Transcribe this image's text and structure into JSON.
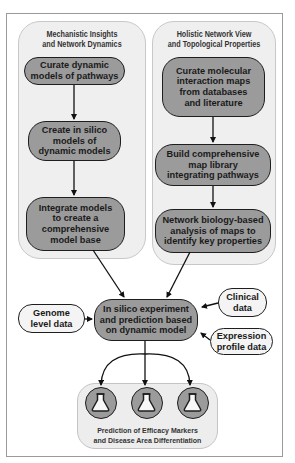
{
  "left_panel": {
    "title": "Mechanistic Insights\nand Network Dynamics",
    "steps": [
      {
        "label": "Curate dynamic\nmodels of pathways"
      },
      {
        "label": "Create in silico\nmodels of\ndynamic models"
      },
      {
        "label": "Integrate models\nto create a\ncomprehensive\nmodel base"
      }
    ]
  },
  "right_panel": {
    "title": "Holistic Network View\nand Topological Properties",
    "steps": [
      {
        "label": "Curate molecular\ninteraction maps\nfrom databases\nand literature"
      },
      {
        "label": "Build comprehensive\nmap library\nintegrating pathways"
      },
      {
        "label": "Network biology-based\nanalysis of maps to\nidentify key properties"
      }
    ]
  },
  "center": {
    "label": "In silico experiment\nand prediction based\non dynamic model"
  },
  "inputs": {
    "genome": "Genome\nlevel data",
    "clinical": "Clinical\ndata",
    "expression": "Expression\nprofile data"
  },
  "outcome": {
    "label": "Prediction of Efficacy Markers\nand Disease Area Differentiation",
    "icons": [
      "flask-icon",
      "flask-icon",
      "flask-icon"
    ]
  },
  "colors": {
    "node_fill": "#9b9b9b",
    "node_border": "#1e1e1e",
    "panel_fill": "#efefef",
    "input_fill": "#f4f4f4"
  }
}
